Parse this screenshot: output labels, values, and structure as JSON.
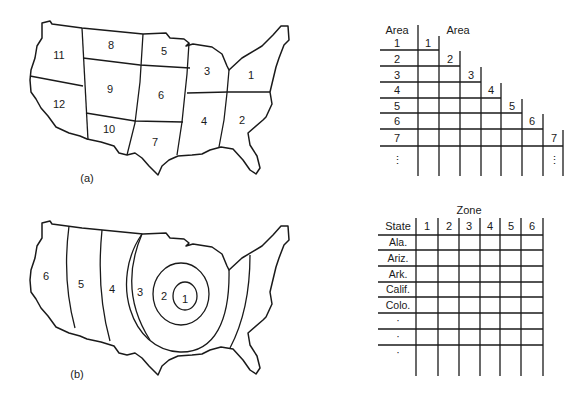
{
  "figure_a": {
    "caption": "(a)",
    "map_areas": [
      {
        "id": "1",
        "x": 251,
        "y": 76
      },
      {
        "id": "2",
        "x": 242,
        "y": 121
      },
      {
        "id": "3",
        "x": 207,
        "y": 72
      },
      {
        "id": "4",
        "x": 204,
        "y": 122
      },
      {
        "id": "5",
        "x": 164,
        "y": 52
      },
      {
        "id": "6",
        "x": 161,
        "y": 96
      },
      {
        "id": "7",
        "x": 155,
        "y": 142
      },
      {
        "id": "8",
        "x": 111,
        "y": 46
      },
      {
        "id": "9",
        "x": 110,
        "y": 90
      },
      {
        "id": "10",
        "x": 109,
        "y": 129
      },
      {
        "id": "11",
        "x": 59,
        "y": 56
      },
      {
        "id": "12",
        "x": 59,
        "y": 104
      }
    ],
    "table": {
      "row_header": "Area",
      "col_header": "Area",
      "rows": [
        "1",
        "2",
        "3",
        "4",
        "5",
        "6",
        "7",
        "⋮"
      ],
      "cols": [
        "1",
        "2",
        "3",
        "4",
        "5",
        "6",
        "7"
      ],
      "col_ellipsis": "⋮"
    }
  },
  "figure_b": {
    "caption": "(b)",
    "map_zones": [
      {
        "id": "6",
        "x": 46,
        "y": 276
      },
      {
        "id": "5",
        "x": 81,
        "y": 284
      },
      {
        "id": "4",
        "x": 112,
        "y": 289
      },
      {
        "id": "3",
        "x": 140,
        "y": 292
      },
      {
        "id": "2",
        "x": 164,
        "y": 296
      },
      {
        "id": "1",
        "x": 184,
        "y": 299
      }
    ],
    "table": {
      "title": "Zone",
      "row_header": "State",
      "cols": [
        "1",
        "2",
        "3",
        "4",
        "5",
        "6"
      ],
      "rows": [
        "Ala.",
        "Ariz.",
        "Ark.",
        "Calif.",
        "Colo.",
        "·",
        "·",
        "·"
      ]
    }
  }
}
